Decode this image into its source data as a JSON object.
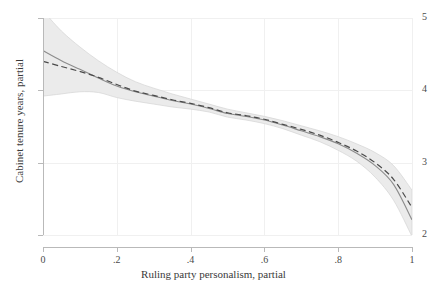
{
  "chart_data": {
    "type": "line",
    "title": "",
    "subtitle": "",
    "xlabel": "Ruling party personalism, partial",
    "ylabel": "Cabinet tenure years, partial",
    "xlim": [
      0,
      1
    ],
    "ylim": [
      2,
      5
    ],
    "xticks": [
      0,
      0.2,
      0.4,
      0.6,
      0.8,
      1
    ],
    "xticklabels": [
      "0",
      ".2",
      ".4",
      ".6",
      ".8",
      "1"
    ],
    "yticks": [
      2,
      3,
      4,
      5
    ],
    "yticklabels": [
      "2",
      "3",
      "4",
      "5"
    ],
    "grid": true,
    "legend": "none",
    "x": [
      0,
      0.05,
      0.1,
      0.15,
      0.2,
      0.25,
      0.3,
      0.35,
      0.4,
      0.45,
      0.5,
      0.55,
      0.6,
      0.65,
      0.7,
      0.75,
      0.8,
      0.85,
      0.9,
      0.95,
      1
    ],
    "series": [
      {
        "name": "fitted-curve",
        "style": "solid",
        "color": "#8c8c8c",
        "values": [
          4.55,
          4.41,
          4.29,
          4.17,
          4.06,
          3.98,
          3.92,
          3.86,
          3.81,
          3.75,
          3.68,
          3.64,
          3.59,
          3.52,
          3.44,
          3.36,
          3.26,
          3.13,
          2.96,
          2.7,
          2.21
        ]
      },
      {
        "name": "reference-curve",
        "style": "dashed",
        "color": "#4a4a4a",
        "values": [
          4.4,
          4.33,
          4.26,
          4.18,
          4.08,
          3.99,
          3.93,
          3.87,
          3.82,
          3.76,
          3.69,
          3.65,
          3.6,
          3.53,
          3.46,
          3.38,
          3.28,
          3.16,
          3.0,
          2.77,
          2.38
        ]
      }
    ],
    "confidence_band": {
      "name": "confidence-interval",
      "color": "#ebebeb",
      "upper": [
        5.1,
        4.82,
        4.6,
        4.41,
        4.25,
        4.12,
        4.03,
        3.95,
        3.88,
        3.81,
        3.74,
        3.69,
        3.64,
        3.58,
        3.51,
        3.44,
        3.36,
        3.26,
        3.14,
        2.96,
        2.62
      ],
      "lower": [
        3.92,
        3.95,
        3.98,
        3.97,
        3.9,
        3.85,
        3.81,
        3.77,
        3.74,
        3.7,
        3.63,
        3.59,
        3.54,
        3.47,
        3.38,
        3.29,
        3.17,
        3.02,
        2.8,
        2.48,
        1.98
      ]
    }
  }
}
